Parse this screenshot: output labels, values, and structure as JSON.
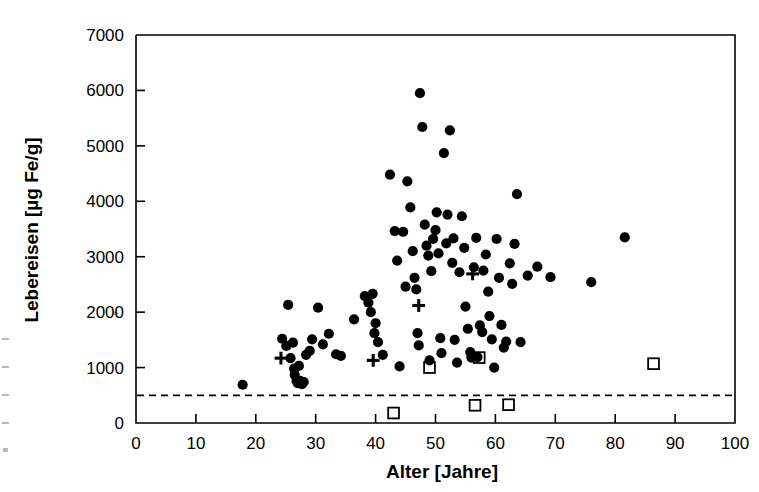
{
  "chart_data": {
    "type": "scatter",
    "title": "",
    "xlabel": "Alter [Jahre]",
    "ylabel": "Lebereisen [µg Fe/g]",
    "xlim": [
      0,
      100
    ],
    "ylim": [
      0,
      7000
    ],
    "xticks": [
      0,
      10,
      20,
      30,
      40,
      50,
      60,
      70,
      80,
      90,
      100
    ],
    "yticks": [
      0,
      1000,
      2000,
      3000,
      4000,
      5000,
      6000,
      7000
    ],
    "xtick_labels": [
      "0",
      "10",
      "20",
      "30",
      "40",
      "50",
      "60",
      "70",
      "80",
      "90",
      "100"
    ],
    "ytick_labels": [
      "0",
      "1000",
      "2000",
      "3000",
      "4000",
      "5000",
      "6000",
      "7000"
    ],
    "grid": false,
    "legend": "none",
    "reference_line": {
      "kind": "horizontal-dashed",
      "y": 500,
      "label": ""
    },
    "series": [
      {
        "name": "filled-circle",
        "marker": "circle-filled",
        "color": "#000000",
        "points": [
          [
            17.8,
            690
          ],
          [
            24.4,
            1520
          ],
          [
            25.1,
            1390
          ],
          [
            25.4,
            2130
          ],
          [
            25.8,
            1170
          ],
          [
            26.2,
            1450
          ],
          [
            26.4,
            980
          ],
          [
            26.5,
            870
          ],
          [
            26.8,
            760
          ],
          [
            27.0,
            720
          ],
          [
            27.2,
            1030
          ],
          [
            27.4,
            760
          ],
          [
            27.7,
            700
          ],
          [
            28.0,
            740
          ],
          [
            28.4,
            1230
          ],
          [
            29.0,
            1300
          ],
          [
            29.4,
            1510
          ],
          [
            30.4,
            2080
          ],
          [
            31.2,
            1420
          ],
          [
            32.2,
            1610
          ],
          [
            33.4,
            1240
          ],
          [
            34.2,
            1210
          ],
          [
            36.4,
            1870
          ],
          [
            38.2,
            2290
          ],
          [
            38.8,
            2170
          ],
          [
            39.2,
            2000
          ],
          [
            39.5,
            2330
          ],
          [
            39.8,
            1620
          ],
          [
            40.0,
            1800
          ],
          [
            40.4,
            1460
          ],
          [
            41.2,
            1230
          ],
          [
            42.4,
            4480
          ],
          [
            43.2,
            3460
          ],
          [
            43.6,
            2930
          ],
          [
            44.0,
            1020
          ],
          [
            44.6,
            3450
          ],
          [
            45.0,
            2460
          ],
          [
            45.3,
            4360
          ],
          [
            45.8,
            3890
          ],
          [
            46.2,
            3100
          ],
          [
            46.5,
            2620
          ],
          [
            46.8,
            2410
          ],
          [
            47.0,
            1620
          ],
          [
            47.2,
            1400
          ],
          [
            47.4,
            5950
          ],
          [
            47.8,
            5340
          ],
          [
            48.2,
            3580
          ],
          [
            48.5,
            3200
          ],
          [
            48.8,
            3020
          ],
          [
            49.0,
            1130
          ],
          [
            49.3,
            2740
          ],
          [
            49.6,
            3320
          ],
          [
            50.0,
            3480
          ],
          [
            50.2,
            3800
          ],
          [
            50.5,
            3060
          ],
          [
            50.8,
            1530
          ],
          [
            51.0,
            1260
          ],
          [
            51.4,
            4870
          ],
          [
            51.8,
            3240
          ],
          [
            52.0,
            3760
          ],
          [
            52.4,
            5280
          ],
          [
            52.8,
            2890
          ],
          [
            53.0,
            3330
          ],
          [
            53.2,
            1500
          ],
          [
            53.6,
            1090
          ],
          [
            54.0,
            2720
          ],
          [
            54.4,
            3730
          ],
          [
            54.8,
            3160
          ],
          [
            55.0,
            2100
          ],
          [
            55.4,
            1700
          ],
          [
            55.8,
            1280
          ],
          [
            56.0,
            1180
          ],
          [
            56.4,
            2810
          ],
          [
            56.8,
            3340
          ],
          [
            57.0,
            1190
          ],
          [
            57.4,
            1760
          ],
          [
            57.8,
            1640
          ],
          [
            58.0,
            2750
          ],
          [
            58.4,
            3040
          ],
          [
            58.8,
            2370
          ],
          [
            59.0,
            1930
          ],
          [
            59.4,
            1510
          ],
          [
            59.8,
            1000
          ],
          [
            60.2,
            3320
          ],
          [
            60.6,
            2620
          ],
          [
            61.0,
            1770
          ],
          [
            61.4,
            1360
          ],
          [
            61.8,
            1470
          ],
          [
            62.4,
            2880
          ],
          [
            62.8,
            2510
          ],
          [
            63.2,
            3230
          ],
          [
            63.6,
            4130
          ],
          [
            64.2,
            1460
          ],
          [
            65.4,
            2660
          ],
          [
            67.0,
            2820
          ],
          [
            69.2,
            2630
          ],
          [
            76.0,
            2540
          ],
          [
            81.6,
            3350
          ]
        ]
      },
      {
        "name": "plus",
        "marker": "plus",
        "color": "#000000",
        "points": [
          [
            24.2,
            1170
          ],
          [
            39.6,
            1130
          ],
          [
            47.2,
            2120
          ],
          [
            56.2,
            2690
          ]
        ]
      },
      {
        "name": "open-square",
        "marker": "square-open",
        "color": "#000000",
        "points": [
          [
            43.0,
            180
          ],
          [
            49.0,
            1000
          ],
          [
            56.6,
            320
          ],
          [
            57.3,
            1180
          ],
          [
            62.2,
            330
          ],
          [
            86.4,
            1070
          ]
        ]
      }
    ]
  },
  "axes": {
    "x_axis_name": "alter-axis",
    "y_axis_name": "lebereisen-axis"
  }
}
